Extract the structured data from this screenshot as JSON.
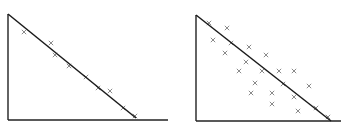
{
  "colors": {
    "axis": "#222222",
    "line": "#1a1a1a",
    "marker": "#8a8a8a",
    "background": "#ffffff"
  },
  "chart_data": [
    {
      "type": "scatter",
      "title": "",
      "xlabel": "",
      "ylabel": "",
      "grid": false,
      "legend": null,
      "marker": "x",
      "description": "Points tightly clustered along a decreasing fitted line",
      "fit_line": {
        "x1": 8,
        "y1": 14,
        "x2": 136,
        "y2": 118
      },
      "axes": {
        "origin": [
          8,
          120
        ],
        "x_end": 168,
        "y_top": 14
      },
      "points": [
        [
          24,
          32
        ],
        [
          51,
          43
        ],
        [
          55,
          55
        ],
        [
          69,
          66
        ],
        [
          86,
          77
        ],
        [
          98,
          88
        ],
        [
          110,
          91
        ],
        [
          123,
          108
        ],
        [
          135,
          116
        ]
      ]
    },
    {
      "type": "scatter",
      "title": "",
      "xlabel": "",
      "ylabel": "",
      "grid": false,
      "legend": null,
      "marker": "x",
      "description": "Points widely scattered around a decreasing fitted line",
      "fit_line": {
        "x1": 196,
        "y1": 15,
        "x2": 331,
        "y2": 121
      },
      "axes": {
        "origin": [
          196,
          121
        ],
        "x_end": 341,
        "y_top": 15
      },
      "points": [
        [
          209,
          23
        ],
        [
          227,
          28
        ],
        [
          213,
          40
        ],
        [
          231,
          43
        ],
        [
          249,
          47
        ],
        [
          225,
          53
        ],
        [
          266,
          55
        ],
        [
          246,
          62
        ],
        [
          239,
          71
        ],
        [
          262,
          71
        ],
        [
          279,
          71
        ],
        [
          294,
          71
        ],
        [
          255,
          83
        ],
        [
          283,
          84
        ],
        [
          309,
          86
        ],
        [
          251,
          93
        ],
        [
          272,
          93
        ],
        [
          294,
          97
        ],
        [
          272,
          104
        ],
        [
          316,
          108
        ],
        [
          298,
          111
        ],
        [
          328,
          117
        ]
      ]
    }
  ]
}
